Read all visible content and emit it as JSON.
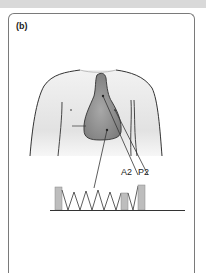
{
  "panel": {
    "label": "(b)"
  },
  "annotations": {
    "a2": "A2",
    "p2": "P2"
  },
  "colors": {
    "torso_fill": "#e6e6e6",
    "heart_fill": "#8c8c8c",
    "outline": "#333333",
    "bar_fill": "#bdbdbd",
    "panel_border": "#7a7a7a"
  },
  "phonocardiogram": {
    "bars": [
      {
        "name": "S1",
        "x": 56,
        "height": 20
      },
      {
        "name": "A2",
        "x": 122,
        "height": 16
      },
      {
        "name": "P2",
        "x": 139,
        "height": 24
      }
    ],
    "murmur": "crescendo-decrescendo zigzag between S1 and A2"
  }
}
